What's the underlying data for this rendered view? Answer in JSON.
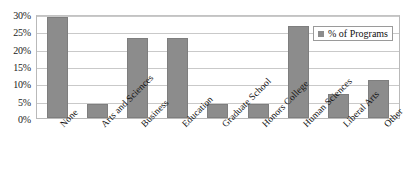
{
  "chart_data": {
    "type": "bar",
    "title": "",
    "subtitle": "",
    "xlabel": "",
    "ylabel": "",
    "categories": [
      "None",
      "Arts and Sciences",
      "Business",
      "Education",
      "Graduate School",
      "Honors College",
      "Human Sciences",
      "Liberal Arts",
      "Other"
    ],
    "series": [
      {
        "name": "% of Programs",
        "values": [
          29,
          4,
          23,
          23,
          4,
          4,
          26.5,
          7,
          11
        ],
        "color": "#8c8c8c"
      }
    ],
    "ylim": [
      0,
      30
    ],
    "y_ticks": [
      0,
      5,
      10,
      15,
      20,
      25,
      30
    ],
    "y_tick_labels": [
      "0%",
      "5%",
      "10%",
      "15%",
      "20%",
      "25%",
      "30%"
    ],
    "grid": true,
    "grid_axis": "y",
    "legend_position": "top-right",
    "legend_entries": [
      "% of Programs"
    ],
    "x_tick_label_rotation": "-45"
  },
  "legend": {
    "label": "% of Programs",
    "swatch_color": "#8c8c8c"
  },
  "axis": {
    "y_tick_0": "0%",
    "y_tick_1": "5%",
    "y_tick_2": "10%",
    "y_tick_3": "15%",
    "y_tick_4": "20%",
    "y_tick_5": "25%",
    "y_tick_6": "30%",
    "x_tick_0": "None",
    "x_tick_1": "Arts and Sciences",
    "x_tick_2": "Business",
    "x_tick_3": "Education",
    "x_tick_4": "Graduate School",
    "x_tick_5": "Honors College",
    "x_tick_6": "Human Sciences",
    "x_tick_7": "Liberal Arts",
    "x_tick_8": "Other"
  }
}
